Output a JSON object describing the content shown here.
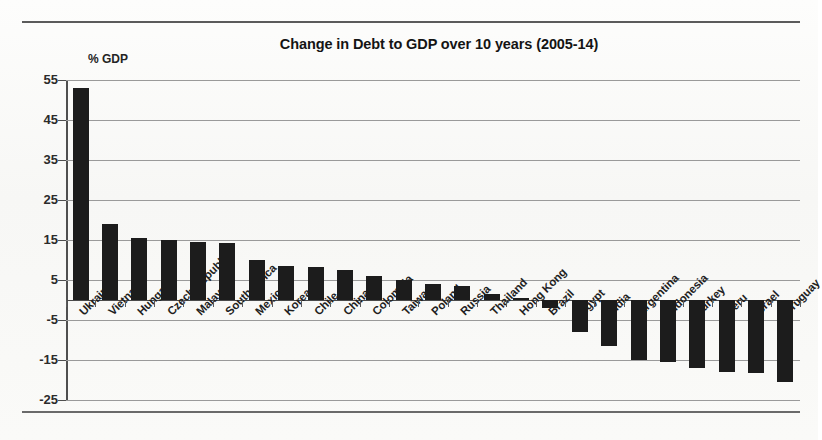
{
  "chart_data": {
    "type": "bar",
    "title": "Change in Debt to GDP over 10 years (2005-14)",
    "xlabel": "",
    "ylabel": "% GDP",
    "ylim": [
      -25,
      55
    ],
    "ytick_step": 10,
    "yticks": [
      55,
      45,
      35,
      25,
      15,
      5,
      -5,
      -15,
      -25
    ],
    "grid": true,
    "legend": "none",
    "categories": [
      "Ukraine",
      "Vietnam",
      "Hungary",
      "Czech Republic",
      "Malaysia",
      "South Africa",
      "Mexico",
      "Korea",
      "Chile",
      "China",
      "Colombia",
      "Taiwan",
      "Poland",
      "Russia",
      "Thailand",
      "Hong Kong",
      "Brazil",
      "Egypt",
      "India",
      "Argentina",
      "Indonesia",
      "Turkey",
      "Peru",
      "Israel",
      "Uruguay"
    ],
    "values": [
      53,
      19,
      15.5,
      15,
      14.5,
      14.2,
      10,
      8.5,
      8.3,
      7.5,
      6,
      5,
      4,
      3.5,
      1.5,
      0.5,
      -2,
      -8,
      -11.5,
      -15,
      -15.5,
      -17,
      -18,
      -18.2,
      -20.5
    ],
    "series": [
      {
        "name": "Change in Debt to GDP",
        "values": [
          53,
          19,
          15.5,
          15,
          14.5,
          14.2,
          10,
          8.5,
          8.3,
          7.5,
          6,
          5,
          4,
          3.5,
          1.5,
          0.5,
          -2,
          -8,
          -11.5,
          -15,
          -15.5,
          -17,
          -18,
          -18.2,
          -20.5
        ]
      }
    ],
    "bar_color": "#1c1c1c",
    "gridline_color": "#9a9a9a",
    "axis_color": "#4f4f4f"
  },
  "yticklabels": [
    "55",
    "45",
    "35",
    "25",
    "15",
    "5",
    "-5",
    "-15",
    "-25"
  ]
}
